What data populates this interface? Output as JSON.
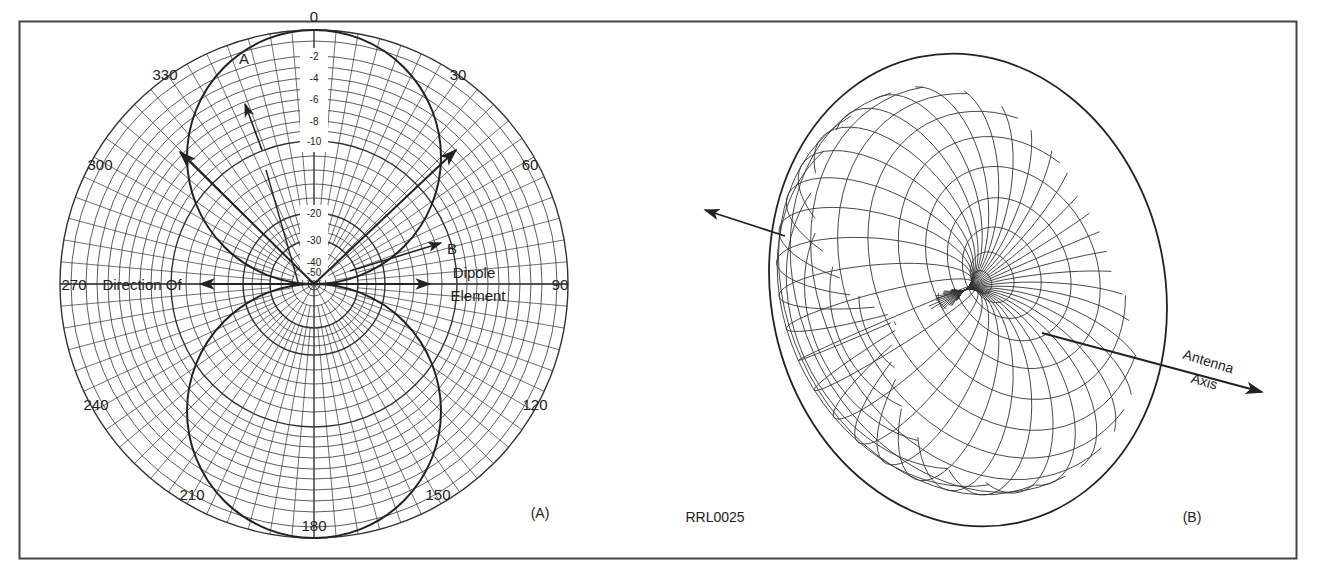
{
  "figure": {
    "id_label": "RRL0025",
    "panel_a_label": "(A)",
    "panel_b_label": "(B)",
    "colors": {
      "ink": "#222222",
      "grid": "#333333",
      "background": "#ffffff"
    }
  },
  "polar": {
    "center": [
      314,
      284
    ],
    "outer_radius": 254,
    "angle_labels": [
      {
        "text": "0",
        "x": 314,
        "y": 22
      },
      {
        "text": "30",
        "x": 458,
        "y": 80
      },
      {
        "text": "60",
        "x": 530,
        "y": 170
      },
      {
        "text": "90",
        "x": 560,
        "y": 290
      },
      {
        "text": "120",
        "x": 535,
        "y": 410
      },
      {
        "text": "150",
        "x": 438,
        "y": 500
      },
      {
        "text": "180",
        "x": 314,
        "y": 531
      },
      {
        "text": "210",
        "x": 192,
        "y": 500
      },
      {
        "text": "240",
        "x": 96,
        "y": 410
      },
      {
        "text": "270",
        "x": 74,
        "y": 290
      },
      {
        "text": "300",
        "x": 100,
        "y": 170
      },
      {
        "text": "330",
        "x": 165,
        "y": 80
      }
    ],
    "db_labels": [
      {
        "text": "-2",
        "r": 228
      },
      {
        "text": "-4",
        "r": 206
      },
      {
        "text": "-6",
        "r": 185
      },
      {
        "text": "-8",
        "r": 163
      },
      {
        "text": "-10",
        "r": 143
      },
      {
        "text": "-20",
        "r": 71
      },
      {
        "text": "-30",
        "r": 44
      },
      {
        "text": "-40",
        "r": 22
      },
      {
        "text": "-50",
        "r": 12
      }
    ],
    "point_a": "A",
    "point_b": "B",
    "direction_of_label": "Direction Of",
    "dipole_label": "Dipole",
    "element_label": "Element"
  },
  "chart_data": {
    "type": "polar",
    "angle_ticks_deg": [
      0,
      30,
      60,
      90,
      120,
      150,
      180,
      210,
      240,
      270,
      300,
      330
    ],
    "radial_ticks_db": [
      0,
      -2,
      -4,
      -6,
      -8,
      -10,
      -20,
      -30,
      -40,
      -50
    ],
    "series": [
      {
        "name": "Dipole pattern (figure-8)",
        "angle_deg": [
          0,
          30,
          60,
          90,
          120,
          150,
          180,
          210,
          240,
          270,
          300,
          330
        ],
        "relative_db": [
          0,
          -1.2,
          -6,
          -50,
          -6,
          -1.2,
          0,
          -1.2,
          -6,
          -50,
          -6,
          -1.2
        ]
      }
    ],
    "annotations": [
      "A",
      "B",
      "Direction Of Dipole Element"
    ]
  },
  "sphere": {
    "antenna_axis_label_1": "Antenna",
    "antenna_axis_label_2": "Axis"
  }
}
